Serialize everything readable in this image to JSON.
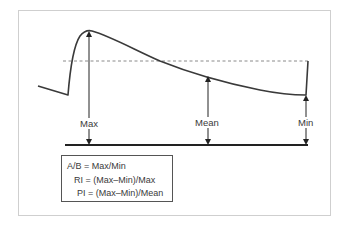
{
  "diagram": {
    "type": "pressure-waveform",
    "labels": {
      "max": "Max",
      "mean": "Mean",
      "min": "Min"
    },
    "formulas": [
      "A/B = Max/Min",
      "RI = (Max–Min)/Max",
      "PI = (Max–Min)/Mean"
    ],
    "colors": {
      "line": "#3a3a3a",
      "dashed": "#8a8a8a",
      "frame": "#cfcfcf"
    }
  }
}
